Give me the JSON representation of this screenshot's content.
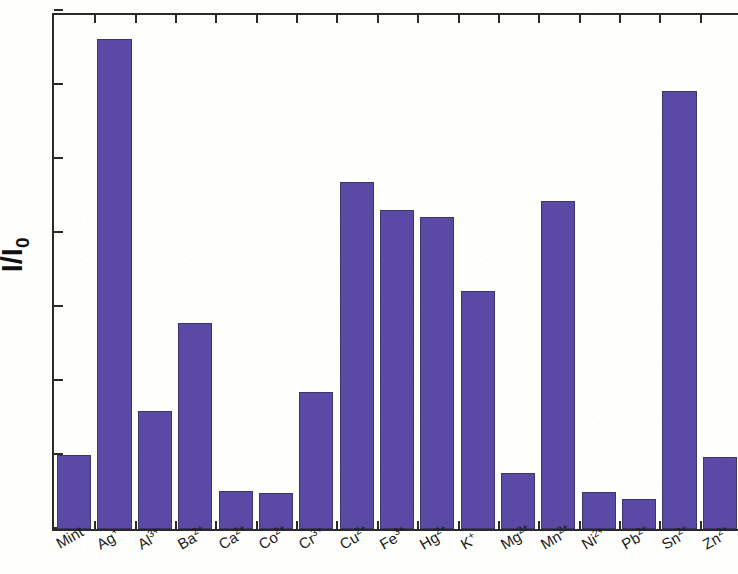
{
  "chart_data": {
    "type": "bar",
    "title": "",
    "xlabel": "",
    "ylabel": "I/I0",
    "ylabel_display": "I/I",
    "ylabel_subscript": "0",
    "ylim": [
      0,
      7
    ],
    "ytick_labels": [
      "0",
      "1",
      "2",
      "3",
      "4",
      "5",
      "6",
      "7"
    ],
    "ytick_values": [
      0,
      1,
      2,
      3,
      4,
      5,
      6,
      7
    ],
    "grid": false,
    "legend": null,
    "bar_color": "#5a4aa6",
    "bar_edge_color": "#3d3470",
    "axis_color": "#2a2a2a",
    "background_color": "#fefefd",
    "categories": [
      "Mint",
      "Ag+",
      "Al3+",
      "Ba2+",
      "Ca2+",
      "Co2+",
      "Cr3+",
      "Cu2+",
      "Fe3+",
      "Hg2+",
      "K+",
      "Mg2+",
      "Mn2+",
      "Ni2+",
      "Pb2+",
      "Sn2+",
      "Zn2+"
    ],
    "category_labels": [
      {
        "base": "Mint",
        "charge": ""
      },
      {
        "base": "Ag",
        "charge": "+"
      },
      {
        "base": "Al",
        "charge": "3+"
      },
      {
        "base": "Ba",
        "charge": "2+"
      },
      {
        "base": "Ca",
        "charge": "2+"
      },
      {
        "base": "Co",
        "charge": "2+"
      },
      {
        "base": "Cr",
        "charge": "3+"
      },
      {
        "base": "Cu",
        "charge": "2+"
      },
      {
        "base": "Fe",
        "charge": "3+"
      },
      {
        "base": "Hg",
        "charge": "2+"
      },
      {
        "base": "K",
        "charge": "+"
      },
      {
        "base": "Mg",
        "charge": "2+"
      },
      {
        "base": "Mn",
        "charge": "2+"
      },
      {
        "base": "Ni",
        "charge": "2+"
      },
      {
        "base": "Pb",
        "charge": "2+"
      },
      {
        "base": "Sn",
        "charge": "2+"
      },
      {
        "base": "Zn",
        "charge": "2+"
      }
    ],
    "values": [
      1.0,
      6.62,
      1.6,
      2.79,
      0.52,
      0.49,
      1.85,
      4.69,
      4.31,
      4.22,
      3.21,
      0.76,
      4.43,
      0.5,
      0.4,
      5.92,
      0.97
    ]
  }
}
